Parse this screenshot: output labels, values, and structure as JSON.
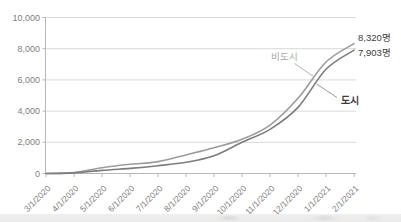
{
  "chart_data": {
    "type": "line",
    "title": "",
    "xlabel": "",
    "ylabel": "",
    "grid": true,
    "legend_position": "inline-callouts",
    "ylim": [
      0,
      10000
    ],
    "ytick_step": 2000,
    "ytick_labels": [
      "0",
      "2,000",
      "4,000",
      "6,000",
      "8,000",
      "10,000"
    ],
    "categories": [
      "3/1/2020",
      "4/1/2020",
      "5/1/2020",
      "6/1/2020",
      "7/1/2020",
      "8/1/2020",
      "9/1/2020",
      "10/1/2020",
      "11/1/2020",
      "12/1/2020",
      "1/1/2021",
      "2/1/2021"
    ],
    "series": [
      {
        "id": "nonurban",
        "name": "비도시",
        "end_label": "8,320명",
        "color": "#9c9c9c",
        "name_label_color": "#a9a9a9",
        "values": [
          0,
          60,
          370,
          590,
          760,
          1190,
          1650,
          2190,
          3100,
          4820,
          7150,
          8320
        ]
      },
      {
        "id": "urban",
        "name": "도시",
        "end_label": "7,903명",
        "color": "#7d7d7d",
        "name_label_color": "#3d3d3d",
        "values": [
          0,
          40,
          200,
          330,
          500,
          720,
          1140,
          2000,
          2830,
          4240,
          6680,
          7903
        ]
      }
    ]
  },
  "colors": {
    "background": "#ffffff",
    "gridline": "#d9d9d9",
    "axis": "#b7b7b7",
    "tick_label": "#808080",
    "value_label": "#404040",
    "callout_light": "#b3b3b3",
    "callout_dark": "#9a9a9a"
  }
}
